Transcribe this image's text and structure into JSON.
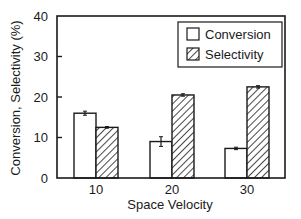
{
  "chart_data": {
    "type": "bar",
    "title": "",
    "xlabel": "Space Velocity",
    "ylabel": "Conversion, Selectivity (%)",
    "categories": [
      "10",
      "20",
      "30"
    ],
    "series": [
      {
        "name": "Conversion",
        "pattern": "open",
        "values": [
          16,
          9,
          7.3
        ],
        "errors": [
          0.5,
          1.2,
          0.3
        ]
      },
      {
        "name": "Selectivity",
        "pattern": "hatched",
        "values": [
          12.5,
          20.5,
          22.5
        ],
        "errors": [
          0.2,
          0.3,
          0.3
        ]
      }
    ],
    "ylim": [
      0,
      40
    ],
    "yticks": [
      "0",
      "10",
      "20",
      "30",
      "40"
    ],
    "grid": false,
    "legend_position": "upper right"
  },
  "colors": {
    "ink": "#1a1a1a",
    "background": "#ffffff"
  }
}
